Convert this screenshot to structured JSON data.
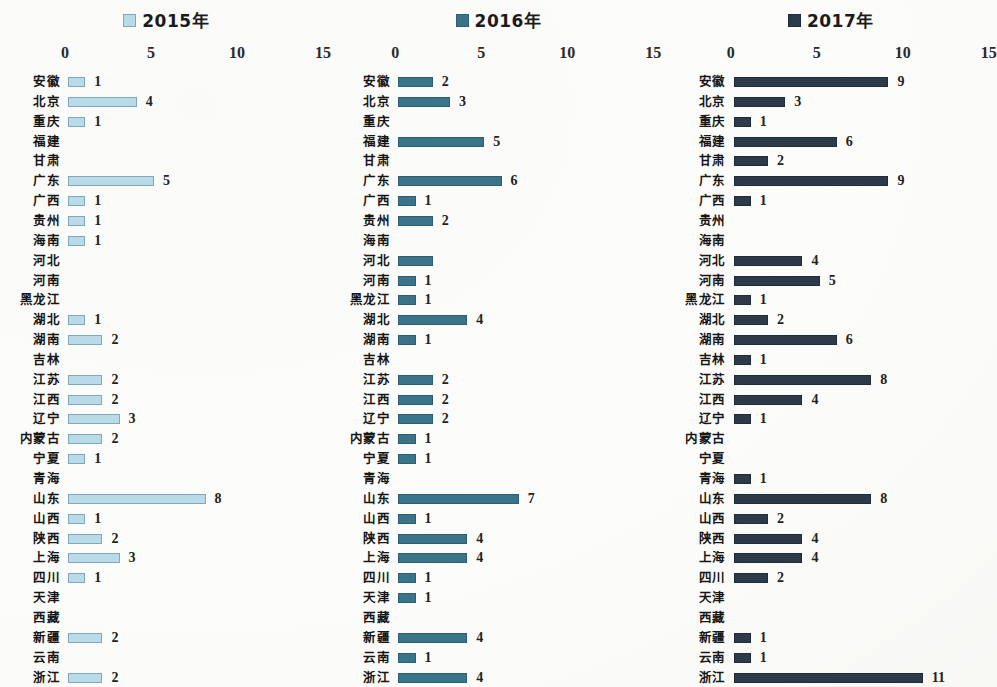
{
  "chart_data": [
    {
      "type": "bar",
      "orientation": "horizontal",
      "title": "2015年",
      "legend_label": "2015年",
      "series_color": "#b9dbe7",
      "series_edge_color": "#7fa9bb",
      "xlabel": "",
      "ylabel": "",
      "xlim": [
        0,
        15
      ],
      "xticks": [
        0,
        5,
        10,
        15
      ],
      "xtick_labels": [
        "0",
        "5",
        "10",
        "15"
      ],
      "grid": false,
      "legend_position": "top-center",
      "categories": [
        "安徽",
        "北京",
        "重庆",
        "福建",
        "甘肃",
        "广东",
        "广西",
        "贵州",
        "海南",
        "河北",
        "河南",
        "黑龙江",
        "湖北",
        "湖南",
        "吉林",
        "江苏",
        "江西",
        "辽宁",
        "内蒙古",
        "宁夏",
        "青海",
        "山东",
        "山西",
        "陕西",
        "上海",
        "四川",
        "天津",
        "西藏",
        "新疆",
        "云南",
        "浙江"
      ],
      "values": [
        1,
        4,
        1,
        0,
        0,
        5,
        1,
        1,
        1,
        0,
        0,
        0,
        1,
        2,
        0,
        2,
        2,
        3,
        2,
        1,
        0,
        8,
        1,
        2,
        3,
        1,
        0,
        0,
        2,
        0,
        2
      ],
      "value_labels": [
        "1",
        "4",
        "1",
        "",
        "",
        "5",
        "1",
        "1",
        "1",
        "",
        "",
        "",
        "1",
        "2",
        "",
        "2",
        "2",
        "3",
        "2",
        "1",
        "",
        "8",
        "1",
        "2",
        "3",
        "1",
        "",
        "",
        "2",
        "",
        "2"
      ]
    },
    {
      "type": "bar",
      "orientation": "horizontal",
      "title": "2016年",
      "legend_label": "2016年",
      "series_color": "#3b7389",
      "series_edge_color": "#2e5e72",
      "xlabel": "",
      "ylabel": "",
      "xlim": [
        0,
        15
      ],
      "xticks": [
        0,
        5,
        10,
        15
      ],
      "xtick_labels": [
        "0",
        "5",
        "10",
        "15"
      ],
      "grid": false,
      "legend_position": "top-center",
      "categories": [
        "安徽",
        "北京",
        "重庆",
        "福建",
        "甘肃",
        "广东",
        "广西",
        "贵州",
        "海南",
        "河北",
        "河南",
        "黑龙江",
        "湖北",
        "湖南",
        "吉林",
        "江苏",
        "江西",
        "辽宁",
        "内蒙古",
        "宁夏",
        "青海",
        "山东",
        "山西",
        "陕西",
        "上海",
        "四川",
        "天津",
        "西藏",
        "新疆",
        "云南",
        "浙江"
      ],
      "values": [
        2,
        3,
        0,
        5,
        0,
        6,
        1,
        2,
        0,
        2,
        1,
        1,
        4,
        1,
        0,
        2,
        2,
        2,
        1,
        1,
        0,
        7,
        1,
        4,
        4,
        1,
        1,
        0,
        4,
        1,
        4
      ],
      "value_labels": [
        "2",
        "3",
        "",
        "5",
        "",
        "6",
        "1",
        "2",
        "",
        "",
        "1",
        "1",
        "4",
        "1",
        "",
        "2",
        "2",
        "2",
        "1",
        "1",
        "",
        "7",
        "1",
        "4",
        "4",
        "1",
        "1",
        "",
        "4",
        "1",
        "4"
      ]
    },
    {
      "type": "bar",
      "orientation": "horizontal",
      "title": "2017年",
      "legend_label": "2017年",
      "series_color": "#2c3a4a",
      "series_edge_color": "#202b38",
      "xlabel": "",
      "ylabel": "",
      "xlim": [
        0,
        15
      ],
      "xticks": [
        0,
        5,
        10,
        15
      ],
      "xtick_labels": [
        "0",
        "5",
        "10",
        "15"
      ],
      "grid": false,
      "legend_position": "top-center",
      "categories": [
        "安徽",
        "北京",
        "重庆",
        "福建",
        "甘肃",
        "广东",
        "广西",
        "贵州",
        "海南",
        "河北",
        "河南",
        "黑龙江",
        "湖北",
        "湖南",
        "吉林",
        "江苏",
        "江西",
        "辽宁",
        "内蒙古",
        "宁夏",
        "青海",
        "山东",
        "山西",
        "陕西",
        "上海",
        "四川",
        "天津",
        "西藏",
        "新疆",
        "云南",
        "浙江"
      ],
      "values": [
        9,
        3,
        1,
        6,
        2,
        9,
        1,
        0,
        0,
        4,
        5,
        1,
        2,
        6,
        1,
        8,
        4,
        1,
        0,
        0,
        1,
        8,
        2,
        4,
        4,
        2,
        0,
        0,
        1,
        1,
        11
      ],
      "value_labels": [
        "9",
        "3",
        "1",
        "6",
        "2",
        "9",
        "1",
        "",
        "",
        "4",
        "5",
        "1",
        "2",
        "6",
        "1",
        "8",
        "4",
        "1",
        "",
        "",
        "1",
        "8",
        "2",
        "4",
        "4",
        "2",
        "",
        "",
        "1",
        "1",
        "11"
      ]
    }
  ]
}
